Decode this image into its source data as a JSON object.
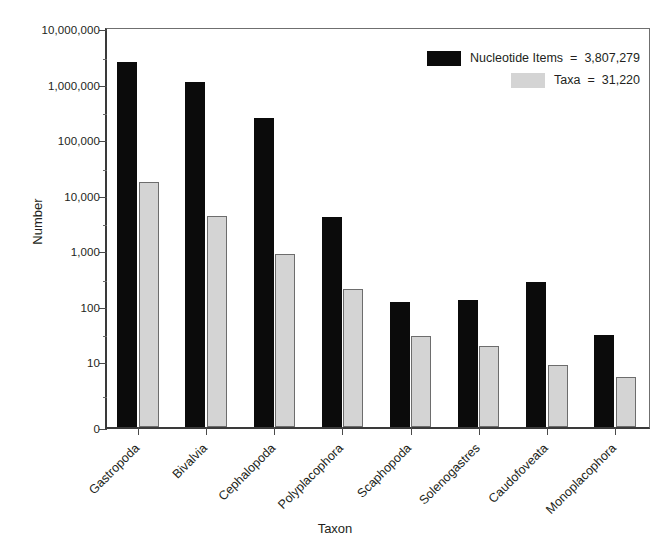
{
  "chart_data": {
    "type": "bar",
    "title": "",
    "xlabel": "Taxon",
    "ylabel": "Number",
    "yscale": "log",
    "ylim": [
      1,
      10000000
    ],
    "ytick_labels": [
      "10,000,000",
      "1,000,000",
      "100,000",
      "10,000",
      "1,000",
      "100",
      "10",
      "0"
    ],
    "ytick_values": [
      10000000,
      1000000,
      100000,
      10000,
      1000,
      100,
      10,
      0
    ],
    "grid": false,
    "legend_position": "top-right",
    "categories": [
      "Gastropoda",
      "Bivalvia",
      "Cephalopoda",
      "Polyplacophora",
      "Scaphopoda",
      "Solenogastres",
      "Caudofoveata",
      "Monoplacophora"
    ],
    "series": [
      {
        "name": "Nucleotide Items",
        "color": "#0b0b0b",
        "total": "3,807,279",
        "total_value": 3807279,
        "values": [
          2400000,
          1070000,
          235000,
          3900,
          115,
          125,
          260,
          30
        ]
      },
      {
        "name": "Taxa",
        "color": "#d4d4d4",
        "total": "31,220",
        "total_value": 31220,
        "values": [
          16500,
          4100,
          850,
          195,
          28,
          19,
          8.5,
          5.2
        ]
      }
    ]
  },
  "legend": {
    "equals": "=",
    "rows": [
      {
        "label": "Nucleotide Items",
        "value": "3,807,279",
        "swatch": "black-swatch"
      },
      {
        "label": "Taxa",
        "value": "31,220",
        "swatch": "grey-swatch"
      }
    ]
  },
  "axes": {
    "y_title": "Number",
    "x_title": "Taxon"
  }
}
